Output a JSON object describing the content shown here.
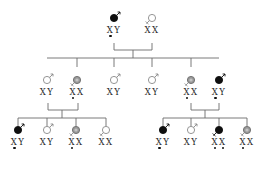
{
  "diagram": {
    "type": "pedigree",
    "colors": {
      "affected": "#0f0f0f",
      "carrier": "#9a9a9a",
      "unaffected_outline": "#8a8a8a",
      "line": "#6b6b6b",
      "text": "#2a2a2a"
    },
    "generations": [
      {
        "id": "I",
        "people": [
          {
            "id": "I-1",
            "sex": "male",
            "status": "affected",
            "x": 114,
            "y": 8,
            "alleles": [
              "X",
              "Y"
            ],
            "marked": [
              true,
              false
            ]
          },
          {
            "id": "I-2",
            "sex": "female",
            "status": "unaffected",
            "x": 152,
            "y": 8,
            "alleles": [
              "X",
              "X"
            ],
            "marked": [
              false,
              false
            ]
          }
        ]
      },
      {
        "id": "II",
        "people": [
          {
            "id": "II-1",
            "sex": "male",
            "status": "unaffected",
            "x": 47,
            "y": 70,
            "alleles": [
              "X",
              "Y"
            ],
            "marked": [
              false,
              false
            ]
          },
          {
            "id": "II-2",
            "sex": "female",
            "status": "carrier",
            "x": 77,
            "y": 70,
            "alleles": [
              "X",
              "X"
            ],
            "marked": [
              true,
              false
            ]
          },
          {
            "id": "II-3",
            "sex": "male",
            "status": "unaffected",
            "x": 114,
            "y": 70,
            "alleles": [
              "X",
              "Y"
            ],
            "marked": [
              false,
              false
            ]
          },
          {
            "id": "II-4",
            "sex": "male",
            "status": "unaffected",
            "x": 152,
            "y": 70,
            "alleles": [
              "X",
              "Y"
            ],
            "marked": [
              false,
              false
            ]
          },
          {
            "id": "II-5",
            "sex": "female",
            "status": "carrier",
            "x": 191,
            "y": 70,
            "alleles": [
              "X",
              "X"
            ],
            "marked": [
              true,
              false
            ]
          },
          {
            "id": "II-6",
            "sex": "male",
            "status": "affected",
            "x": 219,
            "y": 70,
            "alleles": [
              "X",
              "Y"
            ],
            "marked": [
              true,
              false
            ]
          }
        ]
      },
      {
        "id": "III",
        "people": [
          {
            "id": "III-1",
            "sex": "male",
            "status": "affected",
            "x": 18,
            "y": 120,
            "alleles": [
              "X",
              "Y"
            ],
            "marked": [
              true,
              false
            ]
          },
          {
            "id": "III-2",
            "sex": "male",
            "status": "unaffected",
            "x": 47,
            "y": 120,
            "alleles": [
              "X",
              "Y"
            ],
            "marked": [
              false,
              false
            ]
          },
          {
            "id": "III-3",
            "sex": "female",
            "status": "carrier",
            "x": 76,
            "y": 120,
            "alleles": [
              "X",
              "X"
            ],
            "marked": [
              true,
              false
            ]
          },
          {
            "id": "III-4",
            "sex": "female",
            "status": "unaffected",
            "x": 106,
            "y": 120,
            "alleles": [
              "X",
              "X"
            ],
            "marked": [
              false,
              false
            ]
          },
          {
            "id": "III-5",
            "sex": "male",
            "status": "affected",
            "x": 163,
            "y": 120,
            "alleles": [
              "X",
              "Y"
            ],
            "marked": [
              true,
              false
            ]
          },
          {
            "id": "III-6",
            "sex": "male",
            "status": "unaffected",
            "x": 191,
            "y": 120,
            "alleles": [
              "X",
              "Y"
            ],
            "marked": [
              false,
              false
            ]
          },
          {
            "id": "III-7",
            "sex": "female",
            "status": "affected",
            "x": 219,
            "y": 120,
            "alleles": [
              "X",
              "X"
            ],
            "marked": [
              true,
              true
            ]
          },
          {
            "id": "III-8",
            "sex": "female",
            "status": "carrier",
            "x": 247,
            "y": 120,
            "alleles": [
              "X",
              "X"
            ],
            "marked": [
              true,
              false
            ]
          }
        ]
      }
    ],
    "families": [
      {
        "parents": [
          "I-1",
          "I-2"
        ],
        "bracket": {
          "x1": 114,
          "x2": 152,
          "ytop": 43,
          "ybar": 50
        },
        "drop": {
          "x": 133,
          "y1": 50,
          "y2": 58
        },
        "sibline": {
          "x1": 47,
          "x2": 219,
          "y": 58
        },
        "child_drops": [
          {
            "x": 77,
            "y2": 67
          },
          {
            "x": 114,
            "y2": 67
          },
          {
            "x": 152,
            "y2": 67
          },
          {
            "x": 191,
            "y2": 67
          }
        ],
        "children": [
          "II-1",
          "II-2",
          "II-3",
          "II-4",
          "II-5",
          "II-6"
        ]
      },
      {
        "parents": [
          "II-1",
          "II-2"
        ],
        "bracket": {
          "x1": 48,
          "x2": 78,
          "ytop": 103,
          "ybar": 110
        },
        "drop": {
          "x": 62,
          "y1": 110,
          "y2": 118
        },
        "sibline": {
          "x1": 18,
          "x2": 106,
          "y": 118
        },
        "child_drops": [
          {
            "x": 18,
            "y2": 126
          },
          {
            "x": 47,
            "y2": 126
          },
          {
            "x": 76,
            "y2": 126
          },
          {
            "x": 106,
            "y2": 126
          }
        ],
        "children": [
          "III-1",
          "III-2",
          "III-3",
          "III-4"
        ]
      },
      {
        "parents": [
          "II-5",
          "II-6"
        ],
        "bracket": {
          "x1": 191,
          "x2": 219,
          "ytop": 103,
          "ybar": 110
        },
        "drop": {
          "x": 205,
          "y1": 110,
          "y2": 118
        },
        "sibline": {
          "x1": 163,
          "x2": 247,
          "y": 118
        },
        "child_drops": [
          {
            "x": 163,
            "y2": 126
          },
          {
            "x": 191,
            "y2": 126
          },
          {
            "x": 219,
            "y2": 126
          },
          {
            "x": 247,
            "y2": 126
          }
        ],
        "children": [
          "III-5",
          "III-6",
          "III-7",
          "III-8"
        ]
      }
    ]
  }
}
